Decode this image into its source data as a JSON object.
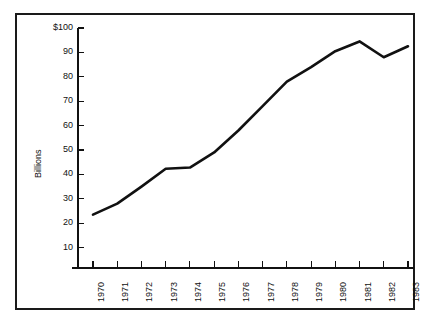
{
  "chart_data": {
    "type": "line",
    "title": "",
    "subtitle": "",
    "xlabel": "",
    "ylabel": "Billions",
    "categories": [
      "1970",
      "1971",
      "1972",
      "1973",
      "1974",
      "1975",
      "1976",
      "1977",
      "1978",
      "1979",
      "1980",
      "1981",
      "1982",
      "1983"
    ],
    "x": [
      1970,
      1971,
      1972,
      1973,
      1974,
      1975,
      1976,
      1977,
      1978,
      1979,
      1980,
      1981,
      1982,
      1983
    ],
    "values": [
      23.5,
      28.0,
      35.0,
      42.3,
      42.8,
      49.0,
      58.0,
      68.0,
      78.0,
      84.0,
      90.5,
      94.5,
      88.0,
      92.5
    ],
    "series": [
      {
        "name": "Billions",
        "values": [
          23.5,
          28.0,
          35.0,
          42.3,
          42.8,
          49.0,
          58.0,
          68.0,
          78.0,
          84.0,
          90.5,
          94.5,
          88.0,
          92.5
        ]
      }
    ],
    "ylim": [
      0,
      100
    ],
    "ytick_values": [
      10,
      20,
      30,
      40,
      50,
      60,
      70,
      80,
      90,
      100
    ],
    "ytick_labels": [
      "10",
      "20",
      "30",
      "40",
      "50",
      "60",
      "70",
      "80",
      "90",
      "$100"
    ],
    "xtick_labels": [
      "1970",
      "1971",
      "1972",
      "1973",
      "1974",
      "1975",
      "1976",
      "1977",
      "1978",
      "1979",
      "1980",
      "1981",
      "1982",
      "1983"
    ],
    "grid": false,
    "legend": false,
    "legend_position": "none",
    "line_color": "#111111",
    "background_color": "#ffffff",
    "axis_color": "#111111",
    "border_color": "#1a1a1a",
    "annotations": []
  },
  "figure": {
    "axis_title_vertical": "Billions",
    "currency_prefix": "$"
  }
}
